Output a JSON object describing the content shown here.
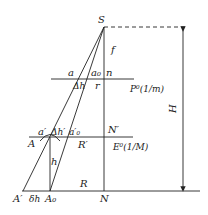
{
  "labels": {
    "S": "S",
    "f": "f",
    "a": "a",
    "a0": "a₀",
    "n": "n",
    "dh": "Δh",
    "r": "r",
    "photo_plane": "P⁰(1/m)",
    "a_prime": "a′",
    "dh_prime": "Δh′",
    "a0_prime": "a′₀",
    "N_prime": "N′",
    "A": "A",
    "R_prime": "R′",
    "ortho_plane": "E⁰(1/M)",
    "h": "h",
    "R": "R",
    "A_prime": "A′",
    "delta_h": "δh",
    "A0": "A₀",
    "N": "N",
    "H": "H"
  },
  "colors": {
    "line": "#222222"
  }
}
